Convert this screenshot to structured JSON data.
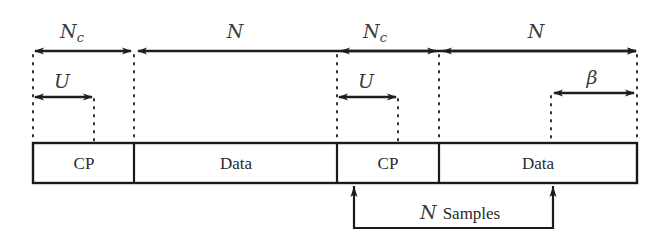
{
  "diagram": {
    "segments": [
      {
        "label": "CP",
        "kind": "cyclic-prefix"
      },
      {
        "label": "Data",
        "kind": "data"
      },
      {
        "label": "CP",
        "kind": "cyclic-prefix"
      },
      {
        "label": "Data",
        "kind": "data"
      }
    ],
    "top_spans": [
      {
        "label_main": "N",
        "label_sub": "c",
        "covers": "CP 1"
      },
      {
        "label_main": "N",
        "label_sub": "",
        "covers": "Data 1"
      },
      {
        "label_main": "N",
        "label_sub": "c",
        "covers": "CP 2"
      },
      {
        "label_main": "N",
        "label_sub": "",
        "covers": "Data 2"
      }
    ],
    "inner_spans": [
      {
        "label": "U",
        "covers": "start of CP 1"
      },
      {
        "label": "U",
        "covers": "start of CP 2"
      },
      {
        "label": "β",
        "covers": "end of Data 2"
      }
    ],
    "window": {
      "label_var": "N",
      "label_text": "Samples"
    }
  }
}
